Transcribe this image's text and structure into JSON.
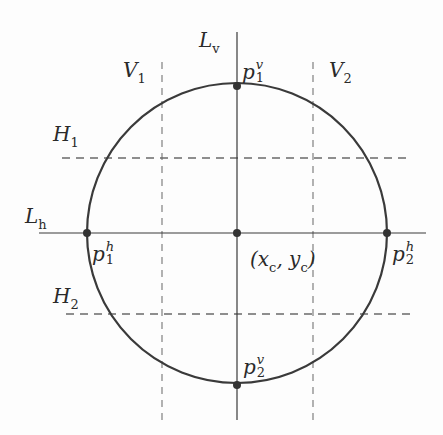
{
  "diagram": {
    "colors": {
      "stroke": "#3a3a3a",
      "dashed": "#7a7a7a",
      "background": "#fdfdfd"
    },
    "circle": {
      "cx": 237,
      "cy": 233,
      "r": 150
    },
    "lines": {
      "Lv": {
        "label": "L",
        "sub": "v"
      },
      "Lh": {
        "label": "L",
        "sub": "h"
      },
      "V1": {
        "label": "V",
        "sub": "1"
      },
      "V2": {
        "label": "V",
        "sub": "2"
      },
      "H1": {
        "label": "H",
        "sub": "1"
      },
      "H2": {
        "label": "H",
        "sub": "2"
      }
    },
    "points": {
      "p1v": {
        "base": "p",
        "sup": "v",
        "sub": "1"
      },
      "p2v": {
        "base": "p",
        "sup": "v",
        "sub": "2"
      },
      "p1h": {
        "base": "p",
        "sup": "h",
        "sub": "1"
      },
      "p2h": {
        "base": "p",
        "sup": "h",
        "sub": "2"
      },
      "center": {
        "text_open": "(x",
        "sub_x": "c",
        "mid": ", y",
        "sub_y": "c",
        "text_close": ")"
      }
    }
  }
}
